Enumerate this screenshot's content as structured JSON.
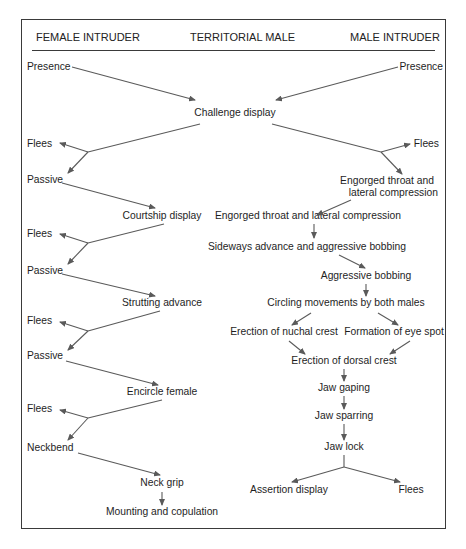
{
  "headers": {
    "left": "FEMALE INTRUDER",
    "center": "TERRITORIAL MALE",
    "right": "MALE INTRUDER"
  },
  "female_intruder": {
    "presence": "Presence",
    "flees_1": "Flees",
    "passive_1": "Passive",
    "flees_2": "Flees",
    "passive_2": "Passive",
    "flees_3": "Flees",
    "passive_3": "Passive",
    "flees_4": "Flees",
    "neckbend": "Neckbend"
  },
  "territorial_male": {
    "challenge_display": "Challenge display",
    "courtship_display": "Courtship display",
    "strutting_advance": "Strutting advance",
    "encircle_female": "Encircle female",
    "neck_grip": "Neck grip",
    "mounting_and_copulation": "Mounting and copulation",
    "engorged_throat": "Engorged throat and lateral compression",
    "sideways_advance": "Sideways advance and aggressive bobbing",
    "aggressive_bobbing": "Aggressive bobbing",
    "circling_movements": "Circling movements by both males",
    "erection_nuchal_crest": "Erection of nuchal crest",
    "formation_eye_spot": "Formation of eye spot",
    "erection_dorsal_crest": "Erection of dorsal crest",
    "jaw_gaping": "Jaw gaping",
    "jaw_sparring": "Jaw sparring",
    "jaw_lock": "Jaw lock",
    "assertion_display": "Assertion display",
    "flees": "Flees"
  },
  "male_intruder": {
    "presence": "Presence",
    "flees": "Flees",
    "engorged_throat_line1": "Engorged throat and",
    "engorged_throat_line2": "lateral compression"
  },
  "colors": {
    "frame": "#3a3a3a",
    "arrow": "#5a5a5a",
    "text": "#1e1e1e",
    "background": "#ffffff"
  }
}
